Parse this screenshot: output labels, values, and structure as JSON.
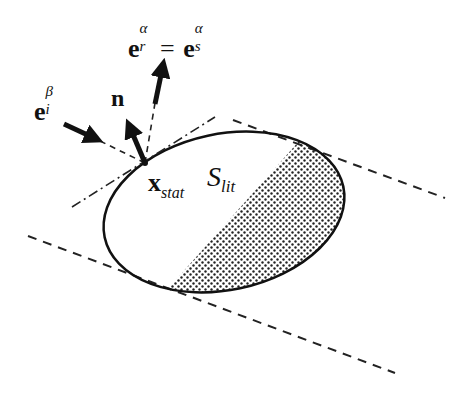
{
  "diagram": {
    "labels": {
      "reflected": {
        "base_left": "e",
        "sup_left": "α",
        "sub_left": "r",
        "equals": "=",
        "base_right": "e",
        "sup_right": "α",
        "sub_right": "s"
      },
      "incident": {
        "base": "e",
        "sup": "β",
        "sub": "i"
      },
      "normal": "n",
      "stationary_point": {
        "base": "x",
        "sub": "stat"
      },
      "lit_surface": {
        "base": "S",
        "sub": "lit"
      }
    },
    "colors": {
      "stroke": "#111111",
      "background": "#ffffff",
      "shading_dot": "#222222"
    }
  }
}
